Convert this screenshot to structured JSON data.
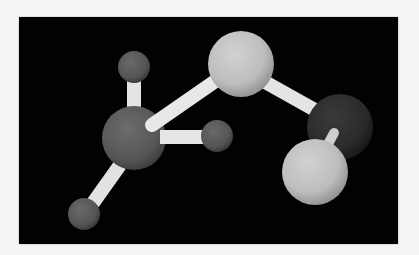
{
  "scene": {
    "background_color": "#f5f5f5",
    "viewport_color": "#020202",
    "viewport": {
      "x": 19,
      "y": 17,
      "width": 379,
      "height": 227
    },
    "bond_color": "#e6e6e6",
    "atoms": [
      {
        "id": "h-top-left",
        "type": "small-grey",
        "cx": 134,
        "cy": 67,
        "r": 16,
        "color": "#5a5a5a"
      },
      {
        "id": "c-central",
        "type": "large-grey",
        "cx": 134,
        "cy": 138,
        "r": 32,
        "color": "#5c5c5c"
      },
      {
        "id": "h-right",
        "type": "small-grey",
        "cx": 217,
        "cy": 136,
        "r": 16,
        "color": "#565656"
      },
      {
        "id": "h-bottom-left",
        "type": "small-grey",
        "cx": 84,
        "cy": 214,
        "r": 16,
        "color": "#555555"
      },
      {
        "id": "light-top",
        "type": "large-light",
        "cx": 241,
        "cy": 64,
        "r": 33,
        "color": "#c4c4c4"
      },
      {
        "id": "dark-right",
        "type": "large-dark",
        "cx": 340,
        "cy": 127,
        "r": 33,
        "color": "#2e2e2e"
      },
      {
        "id": "light-front",
        "type": "large-light",
        "cx": 315,
        "cy": 172,
        "r": 33,
        "color": "#bdbdbd"
      }
    ],
    "bonds": [
      {
        "id": "bond-central-top",
        "x1": 134,
        "y1": 110,
        "x2": 134,
        "y2": 72,
        "width": 14
      },
      {
        "id": "bond-central-right",
        "x1": 162,
        "y1": 137,
        "x2": 206,
        "y2": 137,
        "width": 14
      },
      {
        "id": "bond-central-bottomleft",
        "x1": 120,
        "y1": 165,
        "x2": 93,
        "y2": 203,
        "width": 14
      },
      {
        "id": "bond-central-lighttop",
        "x1": 152,
        "y1": 125,
        "x2": 214,
        "y2": 82,
        "width": 14
      },
      {
        "id": "bond-lighttop-dark",
        "x1": 265,
        "y1": 82,
        "x2": 315,
        "y2": 110,
        "width": 14
      },
      {
        "id": "bond-dark-lightfront",
        "x1": 333,
        "y1": 132,
        "x2": 326,
        "y2": 147,
        "width": 10
      }
    ]
  }
}
